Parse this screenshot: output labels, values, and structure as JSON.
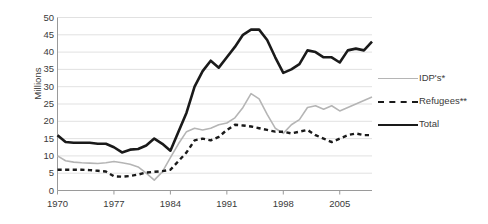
{
  "chart_data": {
    "type": "line",
    "title": "",
    "subtitle": "",
    "xlabel": "",
    "ylabel": "Millions",
    "xlim": [
      1970,
      2009
    ],
    "ylim": [
      0,
      50
    ],
    "grid": true,
    "grid_axis": "y",
    "legend_position": "right",
    "x": [
      1970,
      1971,
      1972,
      1973,
      1974,
      1975,
      1976,
      1977,
      1978,
      1979,
      1980,
      1981,
      1982,
      1983,
      1984,
      1985,
      1986,
      1987,
      1988,
      1989,
      1990,
      1991,
      1992,
      1993,
      1994,
      1995,
      1996,
      1997,
      1998,
      1999,
      2000,
      2001,
      2002,
      2003,
      2004,
      2005,
      2006,
      2007,
      2008,
      2009
    ],
    "xticks": [
      1970,
      1977,
      1984,
      1991,
      1998,
      2005
    ],
    "xticklabels": [
      "1970",
      "1977",
      "1984",
      "1991",
      "1998",
      "2005"
    ],
    "yticks": [
      0,
      5,
      10,
      15,
      20,
      25,
      30,
      35,
      40,
      45,
      50
    ],
    "yticklabels": [
      "0",
      "5",
      "10",
      "15",
      "20",
      "25",
      "30",
      "35",
      "40",
      "45",
      "50"
    ],
    "series": [
      {
        "name": "IDP's*",
        "style": "solid",
        "color": "#b5b5b5",
        "width": 1.6,
        "values": [
          10.0,
          8.6,
          8.2,
          8.0,
          7.9,
          7.8,
          8.0,
          8.4,
          8.0,
          7.6,
          6.8,
          5.0,
          3.0,
          5.4,
          9.5,
          13.5,
          17.0,
          18.0,
          17.5,
          18.0,
          19.0,
          19.5,
          21.0,
          24.0,
          28.0,
          26.5,
          22.0,
          18.0,
          16.5,
          19.0,
          20.5,
          24.0,
          24.5,
          23.5,
          24.5,
          23.0,
          24.0,
          25.0,
          26.0,
          27.0
        ]
      },
      {
        "name": "Refugees**",
        "style": "dashed",
        "color": "#1a1a1a",
        "width": 2.4,
        "values": [
          6.0,
          6.0,
          6.0,
          6.0,
          5.9,
          5.7,
          5.5,
          4.1,
          4.0,
          4.2,
          4.6,
          5.2,
          5.4,
          5.6,
          6.0,
          8.5,
          11.0,
          14.5,
          15.0,
          14.5,
          15.5,
          17.5,
          19.0,
          18.8,
          18.5,
          18.0,
          17.5,
          17.0,
          17.0,
          16.5,
          17.0,
          17.5,
          16.0,
          15.0,
          14.0,
          15.0,
          16.0,
          16.5,
          16.0,
          16.0
        ]
      },
      {
        "name": "Total",
        "style": "solid",
        "color": "#1a1a1a",
        "width": 2.6,
        "values": [
          16.0,
          14.0,
          13.8,
          13.8,
          13.8,
          13.5,
          13.5,
          12.5,
          11.0,
          11.8,
          12.0,
          13.0,
          15.0,
          13.5,
          11.5,
          17.0,
          22.5,
          30.0,
          34.5,
          37.5,
          35.5,
          38.5,
          41.5,
          45.0,
          46.5,
          46.5,
          43.5,
          38.5,
          34.0,
          35.0,
          36.5,
          40.5,
          40.0,
          38.5,
          38.5,
          37.0,
          40.5,
          41.0,
          40.5,
          43.0
        ]
      }
    ]
  },
  "legend": {
    "items": [
      {
        "label": "IDP's*",
        "swatch": "solid-gray-line"
      },
      {
        "label": "Refugees**",
        "swatch": "dashed-black-line"
      },
      {
        "label": "Total",
        "swatch": "solid-black-line"
      }
    ]
  }
}
